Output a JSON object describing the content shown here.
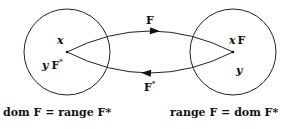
{
  "diagram": {
    "left_set": {
      "top_label": "x",
      "bottom_label_var": "y",
      "bottom_label_op": "F",
      "bottom_label_sup": "*"
    },
    "right_set": {
      "top_label_var": "x",
      "top_label_op": "F",
      "bottom_label": "y"
    },
    "arrows": {
      "forward_label": "F",
      "backward_label": "F",
      "backward_sup": "*"
    },
    "captions": {
      "left": "dom F = range F*",
      "right": "range F = dom F*"
    },
    "colors": {
      "stroke": "#222222",
      "text": "#111111",
      "background": "#ffffff"
    }
  }
}
